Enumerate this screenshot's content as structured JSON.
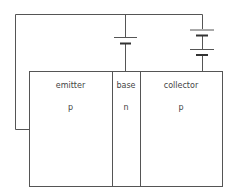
{
  "diagram": {
    "type": "pnp-transistor-bias-circuit",
    "regions": [
      {
        "name": "emitter",
        "label": "emitter",
        "doping": "p"
      },
      {
        "name": "base",
        "label": "base",
        "doping": "n"
      },
      {
        "name": "collector",
        "label": "collector",
        "doping": "p"
      }
    ],
    "batteries": [
      {
        "name": "emitter-base-battery",
        "cells": 1
      },
      {
        "name": "collector-base-battery",
        "cells": 2
      }
    ],
    "colors": {
      "line": "#555555",
      "text": "#444444",
      "background": "#ffffff"
    }
  }
}
